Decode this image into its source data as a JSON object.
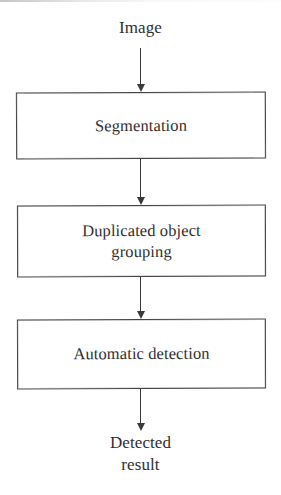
{
  "figure": {
    "type": "flowchart",
    "orientation": "vertical-top-to-bottom",
    "background_color": "#ffffff",
    "line_color": "#3a3a3a",
    "text_color": "#32302f"
  },
  "nodes": {
    "input_label": {
      "name": "Image",
      "lines": [
        "Image"
      ],
      "shape": "text"
    },
    "step_1": {
      "name": "Segmentation",
      "lines": [
        "Segmentation"
      ],
      "shape": "rectangle"
    },
    "step_2": {
      "name": "Duplicated object grouping",
      "lines": [
        "Duplicated object",
        "grouping"
      ],
      "shape": "rectangle"
    },
    "step_3": {
      "name": "Automatic detection",
      "lines": [
        "Automatic detection"
      ],
      "shape": "rectangle"
    },
    "output_label": {
      "name": "Detected result",
      "lines": [
        "Detected",
        "result"
      ],
      "shape": "text"
    }
  },
  "edges": [
    {
      "id": "e1",
      "from": "Image",
      "to": "Segmentation",
      "arrowhead": "down"
    },
    {
      "id": "e2",
      "from": "Segmentation",
      "to": "Duplicated object grouping",
      "arrowhead": "down"
    },
    {
      "id": "e3",
      "from": "Duplicated object grouping",
      "to": "Automatic detection",
      "arrowhead": "down"
    },
    {
      "id": "e4",
      "from": "Automatic detection",
      "to": "Detected result",
      "arrowhead": "down"
    }
  ]
}
